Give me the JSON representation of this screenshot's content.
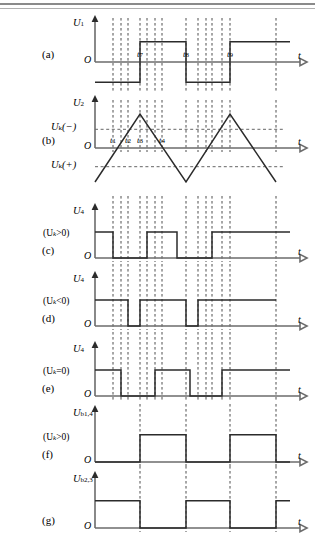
{
  "figure": {
    "title_absent": true,
    "border_rules": 2,
    "time_axis_label": "t",
    "origin_label": "O"
  },
  "panels": [
    {
      "id": "a",
      "tag": "(a)",
      "y_label_main": "U",
      "y_label_sub": "1",
      "condition": "",
      "origin": "O",
      "axis_label": "t",
      "time_marks": [
        {
          "label": "t",
          "sub": "7",
          "x": 140
        },
        {
          "label": "t",
          "sub": "8",
          "x": 186
        },
        {
          "label": "t",
          "sub": "9",
          "x": 230
        }
      ],
      "bipolar": true,
      "waveform": [
        {
          "x": 95,
          "v": -1
        },
        {
          "x": 140,
          "v": -1
        },
        {
          "x": 140,
          "v": 1
        },
        {
          "x": 186,
          "v": 1
        },
        {
          "x": 186,
          "v": -1
        },
        {
          "x": 230,
          "v": -1
        },
        {
          "x": 230,
          "v": 1
        },
        {
          "x": 290,
          "v": 1
        }
      ]
    },
    {
      "id": "b",
      "tag": "(b)",
      "y_label_main": "U",
      "y_label_sub": "2",
      "condition": "",
      "origin": "O",
      "axis_label": "t",
      "threshold_high": {
        "label_main": "U",
        "label_sub": "k",
        "label_tail": "(−)"
      },
      "threshold_low": {
        "label_main": "U",
        "label_sub": "k",
        "label_tail": "(+)"
      },
      "time_marks": [
        {
          "label": "t",
          "sub": "1",
          "x": 113
        },
        {
          "label": "t",
          "sub": "2",
          "x": 128
        },
        {
          "label": "t",
          "sub": "3",
          "x": 140
        },
        {
          "label": "t",
          "sub": "4",
          "x": 162
        }
      ],
      "triangle": {
        "points": [
          {
            "x": 95,
            "v": -1.0
          },
          {
            "x": 140,
            "v": 1.0
          },
          {
            "x": 186,
            "v": -1.0
          },
          {
            "x": 230,
            "v": 1.0
          },
          {
            "x": 276,
            "v": -1.0
          }
        ]
      }
    },
    {
      "id": "c",
      "tag": "(c)",
      "y_label_main": "U",
      "y_label_sub": "4",
      "condition": "(Uₖ>0)",
      "cond_main": "(U",
      "cond_sub": "k",
      "cond_tail": ">0)",
      "origin": "O",
      "axis_label": "t",
      "bipolar": false,
      "waveform": [
        {
          "x": 95,
          "v": 1
        },
        {
          "x": 113,
          "v": 1
        },
        {
          "x": 113,
          "v": 0
        },
        {
          "x": 147,
          "v": 0
        },
        {
          "x": 147,
          "v": 1
        },
        {
          "x": 177,
          "v": 1
        },
        {
          "x": 177,
          "v": 0
        },
        {
          "x": 212,
          "v": 0
        },
        {
          "x": 212,
          "v": 1
        },
        {
          "x": 290,
          "v": 1
        }
      ]
    },
    {
      "id": "d",
      "tag": "(d)",
      "y_label_main": "U",
      "y_label_sub": "4",
      "condition": "(Uₖ<0)",
      "cond_main": "(U",
      "cond_sub": "k",
      "cond_tail": "<0)",
      "origin": "O",
      "axis_label": "t",
      "bipolar": false,
      "waveform": [
        {
          "x": 95,
          "v": 1
        },
        {
          "x": 128,
          "v": 1
        },
        {
          "x": 128,
          "v": 0
        },
        {
          "x": 140,
          "v": 0
        },
        {
          "x": 140,
          "v": 1
        },
        {
          "x": 186,
          "v": 1
        },
        {
          "x": 186,
          "v": 0
        },
        {
          "x": 198,
          "v": 0
        },
        {
          "x": 198,
          "v": 1
        },
        {
          "x": 276,
          "v": 1
        }
      ]
    },
    {
      "id": "e",
      "tag": "(e)",
      "y_label_main": "U",
      "y_label_sub": "4",
      "condition": "(Uₖ=0)",
      "cond_main": "(U",
      "cond_sub": "k",
      "cond_tail": "=0)",
      "origin": "O",
      "axis_label": "t",
      "bipolar": false,
      "waveform": [
        {
          "x": 95,
          "v": 1
        },
        {
          "x": 121,
          "v": 1
        },
        {
          "x": 121,
          "v": 0
        },
        {
          "x": 155,
          "v": 0
        },
        {
          "x": 155,
          "v": 1
        },
        {
          "x": 190,
          "v": 1
        },
        {
          "x": 190,
          "v": 0
        },
        {
          "x": 222,
          "v": 0
        },
        {
          "x": 222,
          "v": 1
        },
        {
          "x": 290,
          "v": 1
        }
      ]
    },
    {
      "id": "f",
      "tag": "(f)",
      "y_label_main": "U",
      "y_label_sub": "b1,4",
      "condition": "(Uₖ>0)",
      "cond_main": "(U",
      "cond_sub": "k",
      "cond_tail": ">0)",
      "origin": "O",
      "axis_label": "t",
      "bipolar": false,
      "waveform": [
        {
          "x": 95,
          "v": 0
        },
        {
          "x": 140,
          "v": 0
        },
        {
          "x": 140,
          "v": 1
        },
        {
          "x": 186,
          "v": 1
        },
        {
          "x": 186,
          "v": 0
        },
        {
          "x": 230,
          "v": 0
        },
        {
          "x": 230,
          "v": 1
        },
        {
          "x": 276,
          "v": 1
        },
        {
          "x": 276,
          "v": 0
        },
        {
          "x": 290,
          "v": 0
        }
      ]
    },
    {
      "id": "g",
      "tag": "(g)",
      "y_label_main": "U",
      "y_label_sub": "b2,3",
      "condition": "",
      "origin": "O",
      "axis_label": "t",
      "bipolar": false,
      "waveform": [
        {
          "x": 95,
          "v": 1
        },
        {
          "x": 140,
          "v": 1
        },
        {
          "x": 140,
          "v": 0
        },
        {
          "x": 186,
          "v": 0
        },
        {
          "x": 186,
          "v": 1
        },
        {
          "x": 230,
          "v": 1
        },
        {
          "x": 230,
          "v": 0
        },
        {
          "x": 276,
          "v": 0
        },
        {
          "x": 276,
          "v": 1
        },
        {
          "x": 290,
          "v": 1
        }
      ]
    }
  ],
  "grid": {
    "dashed_verticals": [
      113,
      121,
      128,
      140,
      147,
      155,
      162,
      186,
      198,
      206,
      212,
      222,
      230,
      276
    ],
    "carrier_verticals": [
      140,
      186,
      230,
      276
    ]
  },
  "chart_data": {
    "type": "line",
    "xlabel": "t",
    "ylabel": "U",
    "grid": true,
    "legend_position": "none",
    "series": [
      {
        "name": "U1 (a) reference square wave",
        "type": "square",
        "levels": [
          -1,
          1,
          -1,
          1
        ]
      },
      {
        "name": "U2 (b) triangular carrier",
        "type": "triangle",
        "peaks": [
          1,
          -1,
          1,
          -1
        ]
      },
      {
        "name": "U4 (c) Uk>0 output",
        "type": "pwm",
        "duty_note": "narrow high at start"
      },
      {
        "name": "U4 (d) Uk<0 output",
        "type": "pwm",
        "duty_note": "wide high pulses"
      },
      {
        "name": "U4 (e) Uk=0 output",
        "type": "pwm",
        "duty_note": "symmetric 50% duty"
      },
      {
        "name": "Ub1,4 (f) gate drive",
        "type": "square",
        "duty_note": "50% duty"
      },
      {
        "name": "Ub2,3 (g) complementary gate drive",
        "type": "square",
        "duty_note": "50% duty inverted"
      }
    ],
    "thresholds": [
      "Uk(-)",
      "Uk(+)"
    ],
    "time_markers": [
      "t1",
      "t2",
      "t3",
      "t4",
      "t7",
      "t8",
      "t9"
    ]
  }
}
